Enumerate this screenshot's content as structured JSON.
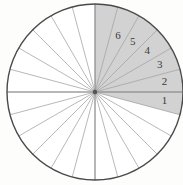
{
  "figure": {
    "type": "sector-diagram",
    "background_color": "#fdfdfc"
  },
  "circle": {
    "center_x": 95,
    "center_y": 92,
    "radius": 88,
    "outline_color": "#4a4a4a",
    "outline_width": 1.4,
    "fill_color": "#ffffff"
  },
  "sectors": {
    "count": 24,
    "angle_degrees": 15,
    "spoke_color": "#9a9a9a",
    "spoke_width": 0.7,
    "shaded_fill": "#d2d2d2",
    "shaded_start_angle": -15,
    "shaded_end_angle": 90,
    "shaded_count": 7
  },
  "axes": {
    "horizontal_line_color": "#8a8a8a",
    "vertical_line_color": "#8a8a8a"
  },
  "labels": [
    {
      "text": "1",
      "angle": -7.5,
      "radius": 70
    },
    {
      "text": "2",
      "angle": 7.5,
      "radius": 70
    },
    {
      "text": "3",
      "angle": 22.5,
      "radius": 70
    },
    {
      "text": "4",
      "angle": 37.5,
      "radius": 66
    },
    {
      "text": "5",
      "angle": 52.5,
      "radius": 62
    },
    {
      "text": "6",
      "angle": 67.5,
      "radius": 60
    }
  ]
}
